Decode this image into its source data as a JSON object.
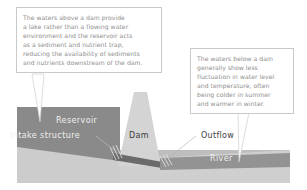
{
  "figure": {
    "type": "dam-cross-section-diagram",
    "background_color": "#ffffff"
  },
  "callouts": [
    {
      "id": "above-dam",
      "text": "The waters above a dam provide\na lake rather than a flowing water\nenvironment and the reservoir acts\nas a sediment and nutrient trap,\nreducing the availability of sediments\nand nutrients downstream of the dam.",
      "text_color": "#8d8d8d",
      "border_color": "#c9c9c9",
      "fill_color": "#ffffff",
      "points_to": "Reservoir"
    },
    {
      "id": "below-dam",
      "text": "The waters below a dam\ngenerally show less\nfluctuation in water level\nand temperature, often\nbeing colder in summer\nand warmer in winter.",
      "text_color": "#8d8d8d",
      "border_color": "#c9c9c9",
      "fill_color": "#ffffff",
      "points_to": "River"
    }
  ],
  "diagram_labels": {
    "reservoir": "Reservoir",
    "intake_structure": "Intake structure",
    "dam": "Dam",
    "outflow": "Outflow",
    "river": "River"
  },
  "colors": {
    "sky": "#ffffff",
    "reservoir_water": "#8a8a8a",
    "dam_body": "#d0d0d0",
    "ground_upper": "#c2c2c2",
    "ground_lower": "#b9b9b9",
    "bank_light": "#d5d5d5",
    "river_water": "#939393",
    "outflow_pipe": "#6e6e6e",
    "leader_line": "#bdbdbd",
    "label_light": "#f0f0f0",
    "label_dark": "#3d3d3d"
  }
}
